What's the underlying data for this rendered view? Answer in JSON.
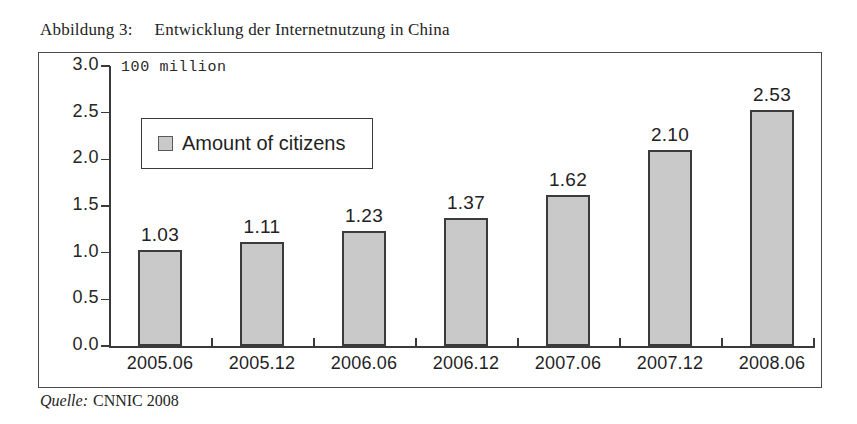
{
  "caption": {
    "label": "Abbildung 3:",
    "title": "Entwicklung der Internetnutzung in China"
  },
  "source": {
    "prefix": "Quelle:",
    "text": "CNNIC 2008"
  },
  "chart_data": {
    "type": "bar",
    "title": "Entwicklung der Internetnutzung in China",
    "unit_label": "100 million",
    "xlabel": "",
    "ylabel": "100 million",
    "categories": [
      "2005.06",
      "2005.12",
      "2006.06",
      "2006.12",
      "2007.06",
      "2007.12",
      "2008.06"
    ],
    "values": [
      1.03,
      1.11,
      1.23,
      1.37,
      1.62,
      2.1,
      2.53
    ],
    "value_labels": [
      "1.03",
      "1.11",
      "1.23",
      "1.37",
      "1.62",
      "2.10",
      "2.53"
    ],
    "series": [
      {
        "name": "Amount of citizens",
        "values": [
          1.03,
          1.11,
          1.23,
          1.37,
          1.62,
          2.1,
          2.53
        ]
      }
    ],
    "ylim": [
      0.0,
      3.0
    ],
    "ytick_labels": [
      "3.0",
      "2.5",
      "2.0",
      "1.5",
      "1.0",
      "0.5",
      "0.0"
    ],
    "ytick_values": [
      3.0,
      2.5,
      2.0,
      1.5,
      1.0,
      0.5,
      0.0
    ],
    "grid": false,
    "legend_position": "upper-left",
    "legend": [
      "Amount of citizens"
    ],
    "bar_color": "#c9c9c9",
    "bar_edge_color": "#3b3b3b"
  }
}
